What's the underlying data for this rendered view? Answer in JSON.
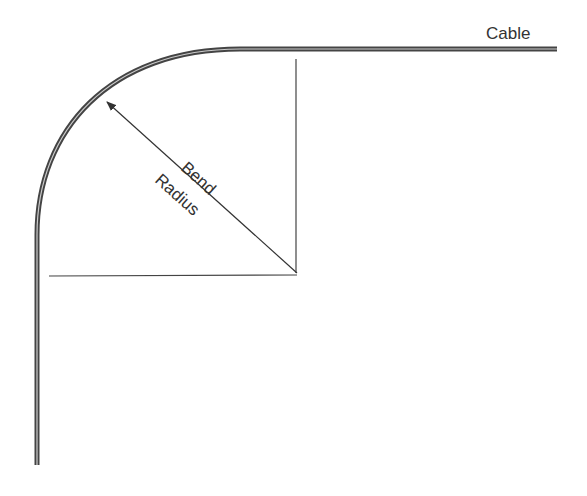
{
  "diagram": {
    "labels": {
      "cable": "Cable",
      "bend": "Bend",
      "radius": "Radius"
    },
    "colors": {
      "line": "#444444",
      "cable": "#555555",
      "background": "#ffffff"
    }
  }
}
